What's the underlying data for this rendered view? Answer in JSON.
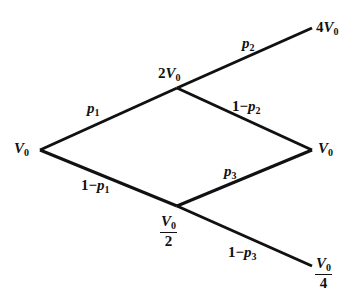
{
  "diagram": {
    "type": "binomial-tree",
    "stroke_color": "#111111",
    "nodes": {
      "root": {
        "label_prefix": "",
        "symbol": "V",
        "subscript": "0"
      },
      "up": {
        "label_prefix": "2",
        "symbol": "V",
        "subscript": "0"
      },
      "down": {
        "numerator_symbol": "V",
        "numerator_subscript": "0",
        "denominator": "2"
      },
      "up_up": {
        "label_prefix": "4",
        "symbol": "V",
        "subscript": "0"
      },
      "middle": {
        "label_prefix": "",
        "symbol": "V",
        "subscript": "0"
      },
      "down_down": {
        "numerator_symbol": "V",
        "numerator_subscript": "0",
        "denominator": "4"
      }
    },
    "edges": {
      "root_up": {
        "prefix": "",
        "symbol": "p",
        "subscript": "1"
      },
      "root_down": {
        "prefix": "1−",
        "symbol": "p",
        "subscript": "1"
      },
      "up_upup": {
        "prefix": "",
        "symbol": "p",
        "subscript": "2"
      },
      "up_middle": {
        "prefix": "1−",
        "symbol": "p",
        "subscript": "2"
      },
      "down_middle": {
        "prefix": "",
        "symbol": "p",
        "subscript": "3"
      },
      "down_downdown": {
        "prefix": "1−",
        "symbol": "p",
        "subscript": "3"
      }
    }
  }
}
